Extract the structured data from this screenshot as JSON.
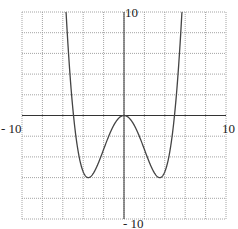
{
  "chart_data": {
    "type": "line",
    "title": "",
    "xlabel": "",
    "ylabel": "",
    "xlim": [
      -10,
      10
    ],
    "ylim": [
      -10,
      10
    ],
    "grid": true,
    "grid_step": 2,
    "tick_labels": {
      "x_min": "- 10",
      "x_max": "10",
      "y_max": "10",
      "y_min": "- 10"
    },
    "series": [
      {
        "name": "quartic",
        "description": "Symmetric W-shaped quartic: local max at (0,0), minima near (-3.5,-6) and (3.5,-6), x-intercepts near ±4.95",
        "x": [
          -5.7,
          -5.5,
          -5.0,
          -4.5,
          -4.0,
          -3.5,
          -3.0,
          -2.5,
          -2.0,
          -1.5,
          -1.0,
          -0.5,
          0,
          0.5,
          1.0,
          1.5,
          2.0,
          2.5,
          3.0,
          3.5,
          4.0,
          4.5,
          5.0,
          5.5,
          5.7
        ],
        "y": [
          10.1,
          7.3,
          0.3,
          -4.0,
          -5.9,
          -6.0,
          -5.3,
          -4.0,
          -2.6,
          -1.4,
          -0.5,
          -0.1,
          0,
          -0.1,
          -0.5,
          -1.4,
          -2.6,
          -4.0,
          -5.3,
          -6.0,
          -5.9,
          -4.0,
          0.3,
          7.3,
          10.1
        ]
      }
    ],
    "legend": null
  },
  "style": {
    "grid_color": "#9a9a9a",
    "axis_color": "#333333",
    "curve_color": "#444444"
  }
}
